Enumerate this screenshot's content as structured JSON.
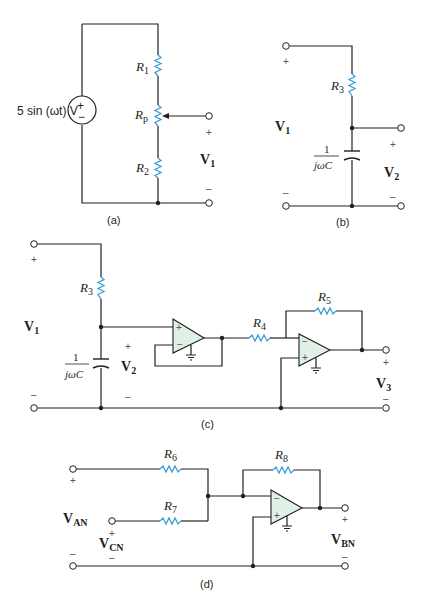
{
  "figure": {
    "panels": [
      {
        "id": "a",
        "caption": "(a)",
        "source_label": "5 sin (ωt) V",
        "source_plus": "+",
        "source_minus": "−",
        "resistors": [
          {
            "name": "R",
            "sub": "1"
          },
          {
            "name": "R",
            "sub": "p"
          },
          {
            "name": "R",
            "sub": "2"
          }
        ],
        "output": {
          "name": "V",
          "sub": "1",
          "plus": "+",
          "minus": "–"
        }
      },
      {
        "id": "b",
        "caption": "(b)",
        "input": {
          "name": "V",
          "sub": "1",
          "plus": "+",
          "minus": "–"
        },
        "resistor": {
          "name": "R",
          "sub": "3"
        },
        "capacitor": {
          "num": "1",
          "den": "jωC"
        },
        "output": {
          "name": "V",
          "sub": "2",
          "plus": "+",
          "minus": "–"
        }
      },
      {
        "id": "c",
        "caption": "(c)",
        "input": {
          "name": "V",
          "sub": "1",
          "plus": "+",
          "minus": "–"
        },
        "resistors": [
          {
            "name": "R",
            "sub": "3"
          },
          {
            "name": "R",
            "sub": "4"
          },
          {
            "name": "R",
            "sub": "5"
          }
        ],
        "capacitor": {
          "num": "1",
          "den": "jωC"
        },
        "mid": {
          "name": "V",
          "sub": "2",
          "plus": "+",
          "minus": "–"
        },
        "opamp1": {
          "plus": "+",
          "minus": "−"
        },
        "opamp2": {
          "plus": "+",
          "minus": "−"
        },
        "output": {
          "name": "V",
          "sub": "3",
          "plus": "+",
          "minus": "–"
        }
      },
      {
        "id": "d",
        "caption": "(d)",
        "input_a": {
          "name": "V",
          "sub": "AN",
          "plus": "+",
          "minus": "–"
        },
        "input_c": {
          "name": "V",
          "sub": "CN",
          "plus": "+",
          "minus": "–"
        },
        "resistors": [
          {
            "name": "R",
            "sub": "6"
          },
          {
            "name": "R",
            "sub": "7"
          },
          {
            "name": "R",
            "sub": "8"
          }
        ],
        "opamp": {
          "plus": "+",
          "minus": "−"
        },
        "output": {
          "name": "V",
          "sub": "BN",
          "plus": "+",
          "minus": "–"
        }
      }
    ],
    "colors": {
      "wire": "#231f20",
      "resistor": "#3d9fd6",
      "opamp_fill": "#dff0e6"
    }
  }
}
